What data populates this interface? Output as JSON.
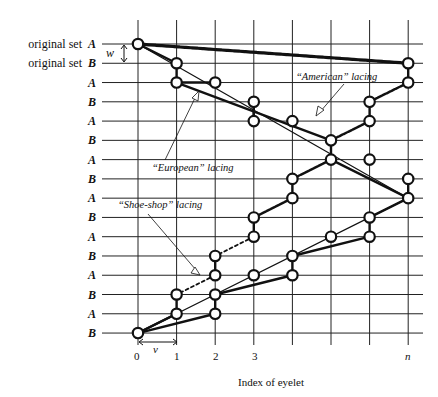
{
  "figure": {
    "row_labels": [
      {
        "prefix": "original set",
        "letter": "A"
      },
      {
        "prefix": "original set",
        "letter": "B"
      },
      {
        "prefix": "",
        "letter": "A"
      },
      {
        "prefix": "",
        "letter": "B"
      },
      {
        "prefix": "",
        "letter": "A"
      },
      {
        "prefix": "",
        "letter": "B"
      },
      {
        "prefix": "",
        "letter": "A"
      },
      {
        "prefix": "",
        "letter": "B"
      },
      {
        "prefix": "",
        "letter": "A"
      },
      {
        "prefix": "",
        "letter": "B"
      },
      {
        "prefix": "",
        "letter": "A"
      },
      {
        "prefix": "",
        "letter": "B"
      },
      {
        "prefix": "",
        "letter": "A"
      },
      {
        "prefix": "",
        "letter": "B"
      },
      {
        "prefix": "",
        "letter": "A"
      },
      {
        "prefix": "",
        "letter": "B"
      }
    ],
    "x_ticks": [
      "0",
      "1",
      "2",
      "3",
      "n"
    ],
    "x_axis_title": "Index of eyelet",
    "dimension_w": "w",
    "dimension_v": "v",
    "annotations": {
      "american": "“American” lacing",
      "european": "“European” lacing",
      "shoe_shop": "“Shoe-shop” lacing"
    },
    "grid": {
      "columns": 8,
      "rows": 16
    },
    "eyelets": [
      [
        0,
        0
      ],
      [
        1,
        1
      ],
      [
        1,
        2
      ],
      [
        2,
        2
      ],
      [
        7,
        1
      ],
      [
        7,
        2
      ],
      [
        3,
        3
      ],
      [
        3,
        4
      ],
      [
        4,
        4
      ],
      [
        6,
        3
      ],
      [
        6,
        4
      ],
      [
        5,
        5
      ],
      [
        5,
        6
      ],
      [
        6,
        6
      ],
      [
        7,
        7
      ],
      [
        7,
        8
      ],
      [
        4,
        7
      ],
      [
        4,
        8
      ],
      [
        3,
        9
      ],
      [
        3,
        10
      ],
      [
        6,
        9
      ],
      [
        6,
        10
      ],
      [
        5,
        10
      ],
      [
        2,
        11
      ],
      [
        2,
        12
      ],
      [
        4,
        11
      ],
      [
        4,
        12
      ],
      [
        3,
        12
      ],
      [
        1,
        13
      ],
      [
        1,
        14
      ],
      [
        2,
        13
      ],
      [
        2,
        14
      ],
      [
        0,
        15
      ]
    ]
  }
}
